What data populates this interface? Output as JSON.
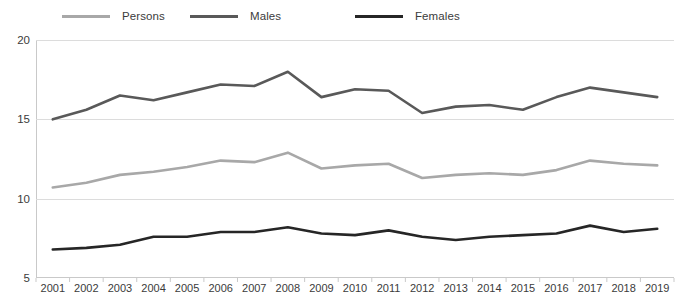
{
  "legend": {
    "items": [
      {
        "label": "Persons",
        "color": "#a8a8a8",
        "key": "persons"
      },
      {
        "label": "Males",
        "color": "#595959",
        "key": "males"
      },
      {
        "label": "Females",
        "color": "#262626",
        "key": "females"
      }
    ]
  },
  "axis": {
    "y_ticks": [
      "5",
      "10",
      "15",
      "20"
    ],
    "x_ticks": [
      "2001",
      "2002",
      "2003",
      "2004",
      "2005",
      "2006",
      "2007",
      "2008",
      "2009",
      "2010",
      "2011",
      "2012",
      "2013",
      "2014",
      "2015",
      "2016",
      "2017",
      "2018",
      "2019"
    ]
  },
  "chart_data": {
    "type": "line",
    "title": "",
    "subtitle": "",
    "xlabel": "",
    "ylabel": "",
    "xlim": [
      2001,
      2019
    ],
    "ylim": [
      5,
      20
    ],
    "grid": true,
    "legend_position": "top",
    "categories": [
      2001,
      2002,
      2003,
      2004,
      2005,
      2006,
      2007,
      2008,
      2009,
      2010,
      2011,
      2012,
      2013,
      2014,
      2015,
      2016,
      2017,
      2018,
      2019
    ],
    "series": [
      {
        "name": "Persons",
        "color": "#a8a8a8",
        "values": [
          10.7,
          11.0,
          11.5,
          11.7,
          12.0,
          12.4,
          12.3,
          12.9,
          11.9,
          12.1,
          12.2,
          11.3,
          11.5,
          11.6,
          11.5,
          11.8,
          12.4,
          12.2,
          12.1
        ]
      },
      {
        "name": "Males",
        "color": "#595959",
        "values": [
          15.0,
          15.6,
          16.5,
          16.2,
          16.7,
          17.2,
          17.1,
          18.0,
          16.4,
          16.9,
          16.8,
          15.4,
          15.8,
          15.9,
          15.6,
          16.4,
          17.0,
          16.7,
          16.4
        ]
      },
      {
        "name": "Females",
        "color": "#262626",
        "values": [
          6.8,
          6.9,
          7.1,
          7.6,
          7.6,
          7.9,
          7.9,
          8.2,
          7.8,
          7.7,
          8.0,
          7.6,
          7.4,
          7.6,
          7.7,
          7.8,
          8.3,
          7.9,
          8.1
        ]
      }
    ]
  }
}
